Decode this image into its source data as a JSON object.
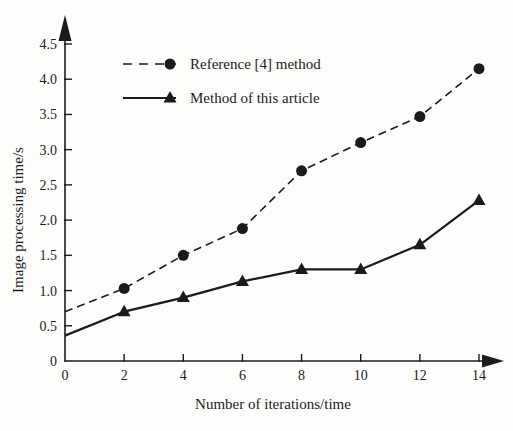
{
  "figure": {
    "background": "#fdfdfc",
    "ink_color": "#1b1b1b"
  },
  "chart_data": {
    "type": "line",
    "title": "",
    "xlabel": "Number of iterations/time",
    "ylabel": "Image processing time/s",
    "xlim": [
      0,
      14
    ],
    "ylim": [
      0,
      4.5
    ],
    "xticks": [
      "0",
      "2",
      "4",
      "6",
      "8",
      "10",
      "12",
      "14"
    ],
    "yticks": [
      "0",
      "0.5",
      "1.0",
      "1.5",
      "2.0",
      "2.5",
      "3.0",
      "3.5",
      "4.0",
      "4.5"
    ],
    "grid": false,
    "legend_position": "upper-left-inside",
    "axis_arrows": true,
    "series": [
      {
        "name": "Reference [4] method",
        "line_style": "dashed",
        "marker": "circle",
        "color": "#1b1b1b",
        "x": [
          0,
          2,
          4,
          6,
          8,
          10,
          12,
          14
        ],
        "y": [
          0.7,
          1.03,
          1.5,
          1.88,
          2.7,
          3.1,
          3.47,
          4.15
        ],
        "marker_start_index": 1
      },
      {
        "name": "Method of this article",
        "line_style": "solid",
        "marker": "triangle",
        "color": "#1b1b1b",
        "x": [
          0,
          2,
          4,
          6,
          8,
          10,
          12,
          14
        ],
        "y": [
          0.36,
          0.7,
          0.9,
          1.13,
          1.3,
          1.3,
          1.65,
          2.28
        ],
        "marker_start_index": 1
      }
    ]
  }
}
